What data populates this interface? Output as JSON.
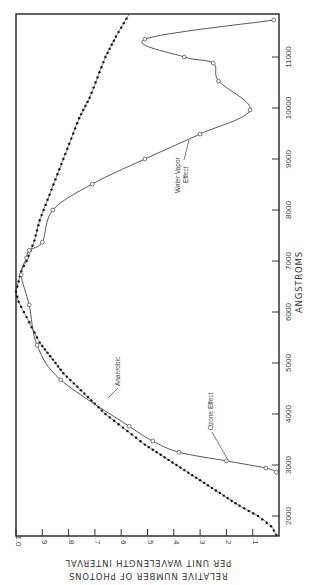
{
  "chart_data": {
    "type": "line",
    "title": "",
    "orientation": "rotated 90 degrees (wavelength runs bottom-to-top, value runs right-to-left)",
    "xlabel": "ANGSTROMS",
    "ylabel": "RELATIVE NUMBER OF PHOTONS PER UNIT WAVELENGTH INTERVAL",
    "ylabel_lines": [
      "RELATIVE NUMBER OF PHOTONS",
      "PER UNIT WAVELENGTH INTERVAL"
    ],
    "xlim": [
      1600,
      11850
    ],
    "ylim": [
      0,
      1.0
    ],
    "x_ticks": [
      2000,
      3000,
      4000,
      5000,
      6000,
      7000,
      8000,
      9000,
      10000,
      11000
    ],
    "x_tick_labels": [
      "2000",
      "3000",
      "4000",
      "5000",
      "6000",
      "7000",
      "8000",
      "9000",
      "10000",
      "11000"
    ],
    "y_ticks": [
      1.0,
      0.9,
      0.8,
      0.7,
      0.6,
      0.5,
      0.4,
      0.3,
      0.2,
      0.1
    ],
    "y_tick_labels": [
      "1.0",
      ".9",
      ".8",
      ".7",
      ".6",
      ".5",
      ".4",
      ".3",
      ".2",
      ".1"
    ],
    "grid": false,
    "series": [
      {
        "name": "Anaerobic",
        "marker": "filled-dot",
        "x": [
          1630,
          1800,
          2000,
          2200,
          2400,
          2600,
          2800,
          3000,
          3200,
          3400,
          3600,
          3800,
          4000,
          4200,
          4400,
          4600,
          4800,
          5000,
          5200,
          5400,
          5600,
          5800,
          6000,
          6200,
          6400,
          6600,
          6800,
          7000,
          7400,
          7800,
          8200,
          8600,
          9000,
          9400,
          9800,
          10200,
          10600,
          11000,
          11400,
          11840
        ],
        "values": [
          0.01,
          0.03,
          0.08,
          0.15,
          0.21,
          0.27,
          0.33,
          0.39,
          0.45,
          0.51,
          0.56,
          0.61,
          0.66,
          0.7,
          0.74,
          0.78,
          0.82,
          0.85,
          0.88,
          0.91,
          0.93,
          0.95,
          0.97,
          0.99,
          1.0,
          0.99,
          0.98,
          0.96,
          0.93,
          0.91,
          0.88,
          0.85,
          0.82,
          0.79,
          0.76,
          0.72,
          0.69,
          0.66,
          0.62,
          0.57
        ]
      },
      {
        "name": "Ozone / Water Vapor (atmosphere-filtered)",
        "marker": "open-circle",
        "x": [
          2860,
          2940,
          3080,
          3250,
          3470,
          3760,
          4670,
          5350,
          6140,
          6730,
          7060,
          7210,
          7370,
          8000,
          8510,
          9000,
          9490,
          9960,
          10530,
          10880,
          11000,
          11350,
          11725
        ],
        "values": [
          0.01,
          0.05,
          0.2,
          0.38,
          0.48,
          0.57,
          0.83,
          0.92,
          0.95,
          0.98,
          0.96,
          0.95,
          0.9,
          0.86,
          0.71,
          0.51,
          0.3,
          0.11,
          0.23,
          0.25,
          0.36,
          0.51,
          0.02
        ]
      }
    ],
    "annotations": [
      {
        "text": "Anaerobic",
        "near_x": 4300,
        "near_y": 0.6
      },
      {
        "text": "Ozone Effect",
        "near_x": 3200,
        "near_y": 0.2
      },
      {
        "text": "Water Vapor Effect",
        "near_x": 9400,
        "near_y": 0.33
      }
    ]
  },
  "labels": {
    "x_axis_title": "ANGSTROMS",
    "y_axis_title_line1": "RELATIVE NUMBER OF PHOTONS",
    "y_axis_title_line2": "PER UNIT WAVELENGTH INTERVAL",
    "annot_anaerobic": "Anaerobic",
    "annot_ozone": "Ozone Effect",
    "annot_water_line1": "Water Vapor",
    "annot_water_line2": "Effect"
  }
}
